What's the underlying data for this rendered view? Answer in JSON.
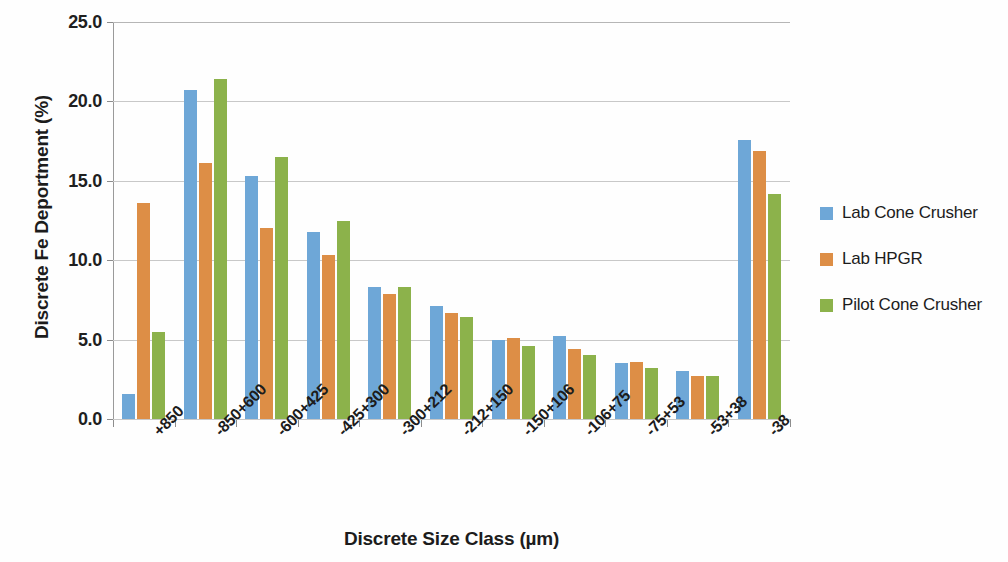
{
  "chart_data": {
    "type": "bar",
    "title": "",
    "xlabel": "Discrete Size Class (µm)",
    "ylabel": "Discrete Fe Deportment (%)",
    "ylim": [
      0.0,
      25.0
    ],
    "ytick_step": 5.0,
    "ytick_labels": [
      "0.0",
      "5.0",
      "10.0",
      "15.0",
      "20.0",
      "25.0"
    ],
    "ytick_values": [
      0.0,
      5.0,
      10.0,
      15.0,
      20.0,
      25.0
    ],
    "grid": true,
    "grid_axis": "y",
    "legend_position": "right",
    "categories": [
      "+850",
      "-850+600",
      "-600+425",
      "-425+300",
      "-300+212",
      "-212+150",
      "-150+106",
      "-106+75",
      "-75+53",
      "-53+38",
      "-38"
    ],
    "series": [
      {
        "name": "Lab Cone Crusher",
        "color": "#6ea7d7",
        "values": [
          1.6,
          20.7,
          15.3,
          11.8,
          8.3,
          7.1,
          5.0,
          5.2,
          3.5,
          3.0,
          17.6
        ]
      },
      {
        "name": "Lab HPGR",
        "color": "#dd8e46",
        "values": [
          13.6,
          16.1,
          12.0,
          10.3,
          7.9,
          6.7,
          5.1,
          4.4,
          3.6,
          2.7,
          16.9
        ]
      },
      {
        "name": "Pilot Cone Crusher",
        "color": "#8cb24b",
        "values": [
          5.5,
          21.4,
          16.5,
          12.5,
          8.3,
          6.4,
          4.6,
          4.0,
          3.2,
          2.7,
          14.2
        ]
      }
    ]
  },
  "legend": {
    "items": [
      {
        "label": "Lab Cone Crusher",
        "color": "#6ea7d7",
        "swatch_name": "legend-swatch-blue"
      },
      {
        "label": "Lab HPGR",
        "color": "#dd8e46",
        "swatch_name": "legend-swatch-orange"
      },
      {
        "label": "Pilot Cone Crusher",
        "color": "#8cb24b",
        "swatch_name": "legend-swatch-green"
      }
    ]
  }
}
